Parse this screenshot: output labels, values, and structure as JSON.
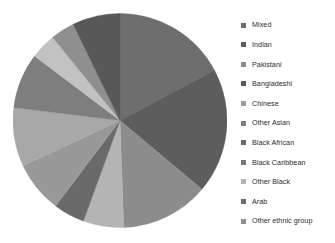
{
  "chart_data": {
    "type": "pie",
    "title": "",
    "legend_position": "right",
    "grid": false,
    "categories": [
      "Mixed",
      "Indian",
      "Pakistani",
      "Bangladeshi",
      "Chinese",
      "Other Asian",
      "Black African",
      "Black Caribbean",
      "Other Black",
      "Arab",
      "Other ethnic group"
    ],
    "values": [
      17.2,
      18.9,
      13.3,
      6.1,
      4.7,
      7.8,
      8.9,
      8.3,
      3.9,
      3.6,
      7.3
    ],
    "angles_deg": [
      62,
      68,
      48,
      22,
      17,
      28,
      32,
      30,
      14,
      13,
      26
    ],
    "start_angle_deg": 0,
    "direction": "clockwise",
    "colors": [
      "#6e6e6e",
      "#5d5d5d",
      "#8c8c8c",
      "#b4b4b4",
      "#6a6a6a",
      "#999999",
      "#a8a8a8",
      "#7e7e7e",
      "#c2c2c2",
      "#8f8f8f",
      "#585858"
    ]
  },
  "legend": {
    "items": [
      {
        "label": "Mixed",
        "color": "#6e6e6e"
      },
      {
        "label": "Indian",
        "color": "#5d5d5d"
      },
      {
        "label": "Pakistani",
        "color": "#8c8c8c"
      },
      {
        "label": "Bangladeshi",
        "color": "#585858"
      },
      {
        "label": "Chinese",
        "color": "#9a9a9a"
      },
      {
        "label": "Other Asian",
        "color": "#7e7e7e"
      },
      {
        "label": "Black  African",
        "color": "#6a6a6a"
      },
      {
        "label": "Black Caribbean",
        "color": "#777777"
      },
      {
        "label": "Other Black",
        "color": "#b4b4b4"
      },
      {
        "label": "Arab",
        "color": "#6e6e6e"
      },
      {
        "label": "Other ethnic group",
        "color": "#8f8f8f"
      }
    ]
  }
}
